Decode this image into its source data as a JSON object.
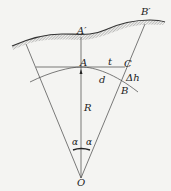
{
  "diagram": {
    "type": "geometry",
    "labels": {
      "A_prime": "A′",
      "B_prime": "B′",
      "A": "A",
      "t": "t",
      "C": "C",
      "d": "d",
      "delta_h": "Δh",
      "B": "B",
      "R": "R",
      "alpha_left": "α",
      "alpha_right": "α",
      "O": "O"
    },
    "points": {
      "O": [
        81,
        178
      ],
      "A": [
        81,
        68
      ],
      "A_prime": [
        81,
        37
      ],
      "C": [
        122,
        67
      ],
      "B": [
        117,
        84
      ],
      "B_prime": [
        145,
        20
      ]
    },
    "colors": {
      "line": "#333333",
      "hatch": "#555555",
      "background": "#f4f4f2"
    }
  }
}
